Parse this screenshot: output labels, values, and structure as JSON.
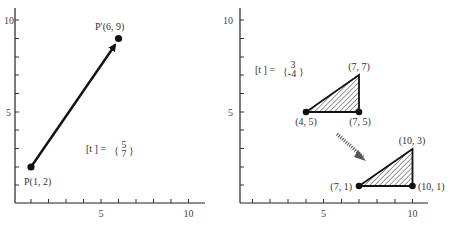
{
  "panels": [
    {
      "name": "translation-of-point",
      "axes": {
        "x_ticks": [
          "5",
          "10"
        ],
        "y_ticks": [
          "5",
          "10"
        ],
        "xlim": [
          0,
          11
        ],
        "ylim": [
          0,
          10.5
        ]
      },
      "point_start": {
        "label": "P(1, 2)",
        "x": 1,
        "y": 2
      },
      "point_end": {
        "label": "P′(6, 9)",
        "x": 6,
        "y": 9
      },
      "translation": {
        "prefix": "[t ] =",
        "tx": "5",
        "ty": "7"
      }
    },
    {
      "name": "translation-of-triangle",
      "axes": {
        "x_ticks": [
          "5",
          "10"
        ],
        "y_ticks": [
          "5",
          "10"
        ],
        "xlim": [
          0,
          11
        ],
        "ylim": [
          0,
          10.5
        ]
      },
      "triangle_original": {
        "vertices": [
          {
            "label": "(4, 5)",
            "x": 4,
            "y": 5
          },
          {
            "label": "(7, 5)",
            "x": 7,
            "y": 5
          },
          {
            "label": "(7, 7)",
            "x": 7,
            "y": 7
          }
        ]
      },
      "triangle_translated": {
        "vertices": [
          {
            "label": "(7, 1)",
            "x": 7,
            "y": 1
          },
          {
            "label": "(10, 1)",
            "x": 10,
            "y": 1
          },
          {
            "label": "(10, 3)",
            "x": 10,
            "y": 3
          }
        ]
      },
      "translation": {
        "prefix": "[t ] =",
        "tx": "3",
        "ty": "-4"
      }
    }
  ],
  "colors": {
    "ink": "#111111",
    "text": "#333333",
    "background": "#ffffff"
  }
}
